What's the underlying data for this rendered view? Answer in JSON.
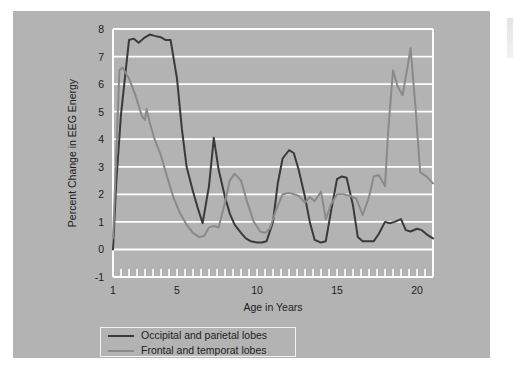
{
  "figure": {
    "background": "#ffffff",
    "panel_color": "#b3b3b3",
    "plot_frame_color": "#ffffff",
    "gridline_color": "#ffffff"
  },
  "legend": {
    "position": "below-axis",
    "entries": [
      {
        "label": "Occipital and parietal lobes",
        "color": "#3a3a3a"
      },
      {
        "label": "Frontal and temporat lobes",
        "color": "#8a8a8a"
      }
    ]
  },
  "chart_data": {
    "type": "line",
    "title": "",
    "xlabel": "Age in Years",
    "ylabel": "Percent Change in EEG Energy",
    "xlim": [
      1,
      21
    ],
    "ylim": [
      -1,
      8
    ],
    "xticks": [
      1,
      5,
      10,
      15,
      20
    ],
    "xtick_labels": [
      "1",
      "5",
      "10",
      "15",
      "20"
    ],
    "minor_xtick_interval": 0.5,
    "yticks": [
      -1,
      0,
      1,
      2,
      3,
      4,
      5,
      6,
      7,
      8
    ],
    "ytick_labels": [
      "-1",
      "0",
      "1",
      "2",
      "3",
      "4",
      "5",
      "6",
      "7",
      "8"
    ],
    "grid": "horizontal",
    "legend_position": "below-plot",
    "series": [
      {
        "name": "Occipital and parietal lobes",
        "color": "#3a3a3a",
        "linewidth": 2.0,
        "x": [
          1.0,
          1.2,
          1.5,
          2.0,
          2.3,
          2.6,
          3.0,
          3.3,
          3.6,
          4.0,
          4.3,
          4.6,
          5.0,
          5.3,
          5.6,
          6.0,
          6.3,
          6.6,
          7.0,
          7.3,
          7.6,
          8.0,
          8.3,
          8.6,
          9.0,
          9.3,
          9.6,
          10.0,
          10.3,
          10.6,
          11.0,
          11.3,
          11.6,
          12.0,
          12.3,
          12.6,
          13.0,
          13.3,
          13.6,
          14.0,
          14.3,
          14.6,
          15.0,
          15.3,
          15.6,
          16.0,
          16.3,
          16.6,
          17.0,
          17.3,
          17.6,
          18.0,
          18.3,
          18.6,
          19.0,
          19.3,
          19.6,
          20.0,
          20.3,
          20.6,
          21.0
        ],
        "y": [
          0.0,
          2.4,
          4.9,
          7.6,
          7.65,
          7.5,
          7.7,
          7.8,
          7.75,
          7.7,
          7.6,
          7.6,
          6.2,
          4.4,
          3.0,
          2.1,
          1.5,
          0.95,
          2.3,
          4.05,
          2.9,
          1.9,
          1.3,
          0.9,
          0.6,
          0.4,
          0.3,
          0.25,
          0.25,
          0.3,
          1.0,
          2.4,
          3.3,
          3.6,
          3.5,
          2.9,
          1.9,
          1.0,
          0.35,
          0.25,
          0.3,
          1.3,
          2.55,
          2.65,
          2.6,
          1.6,
          0.45,
          0.3,
          0.3,
          0.3,
          0.55,
          1.0,
          0.95,
          1.0,
          1.1,
          0.7,
          0.65,
          0.75,
          0.7,
          0.55,
          0.4
        ]
      },
      {
        "name": "Frontal and temporat lobes",
        "color": "#8a8a8a",
        "linewidth": 2.0,
        "x": [
          1.0,
          1.2,
          1.4,
          1.6,
          2.0,
          2.4,
          2.8,
          3.0,
          3.1,
          3.3,
          3.6,
          4.0,
          4.4,
          4.8,
          5.2,
          5.6,
          6.0,
          6.4,
          6.7,
          7.0,
          7.3,
          7.6,
          8.0,
          8.3,
          8.6,
          9.0,
          9.4,
          9.8,
          10.2,
          10.5,
          10.8,
          11.2,
          11.6,
          12.0,
          12.3,
          12.6,
          13.0,
          13.3,
          13.6,
          14.0,
          14.3,
          14.6,
          15.0,
          15.4,
          15.8,
          16.2,
          16.6,
          17.0,
          17.3,
          17.6,
          18.0,
          18.2,
          18.5,
          18.8,
          19.1,
          19.4,
          19.6,
          19.9,
          20.2,
          20.6,
          21.0
        ],
        "y": [
          0.4,
          3.4,
          6.5,
          6.6,
          6.2,
          5.6,
          4.85,
          4.7,
          5.1,
          4.6,
          4.0,
          3.4,
          2.6,
          1.85,
          1.3,
          0.9,
          0.6,
          0.45,
          0.5,
          0.8,
          0.85,
          0.8,
          1.7,
          2.5,
          2.75,
          2.5,
          1.7,
          1.0,
          0.65,
          0.6,
          0.75,
          1.45,
          2.0,
          2.05,
          2.0,
          1.95,
          1.7,
          1.9,
          1.75,
          2.1,
          1.1,
          1.6,
          2.0,
          2.0,
          1.95,
          1.85,
          1.25,
          1.9,
          2.65,
          2.7,
          2.3,
          4.3,
          6.5,
          5.9,
          5.6,
          6.6,
          7.3,
          5.2,
          2.8,
          2.65,
          2.4
        ]
      }
    ]
  }
}
